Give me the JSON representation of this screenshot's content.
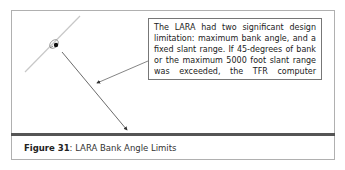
{
  "figure": {
    "callout": {
      "lines": [
        "The LARA had two significant design",
        "limitation: maximum bank angle, and a",
        "fixed slant range. If 45-degrees of bank",
        "or the maximum 5000 foot slant range",
        "was exceeded, the TFR computer"
      ]
    },
    "caption": {
      "label": "Figure 31",
      "separator": ": ",
      "title": "LARA Bank Angle Limits"
    },
    "colors": {
      "ground_line": "#555555",
      "arrow": "#444444",
      "wing": "#c8c8c8",
      "frame_border": "#b0b0b0"
    },
    "values": {
      "max_bank_angle_deg": "45",
      "max_slant_range_ft": "5000"
    }
  }
}
